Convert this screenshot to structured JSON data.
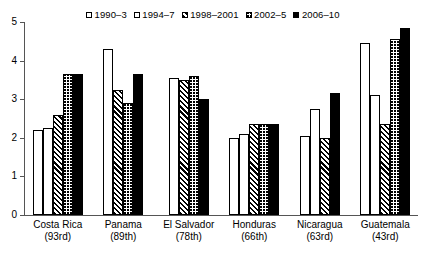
{
  "chart_data": {
    "type": "bar",
    "title": "",
    "xlabel": "",
    "ylabel": "",
    "ylim": [
      0,
      5
    ],
    "yticks": [
      "0",
      "1",
      "2",
      "3",
      "4",
      "5"
    ],
    "grid": false,
    "legend_position": "top",
    "categories": [
      "Costa Rica",
      "Panama",
      "El Salvador",
      "Honduras",
      "Nicaragua",
      "Guatemala"
    ],
    "category_ranks": [
      "(93rd)",
      "(89th)",
      "(78th)",
      "(66th)",
      "(63rd)",
      "(43rd)"
    ],
    "series": [
      {
        "name": "1990–3",
        "pattern": "white",
        "values": [
          2.2,
          null,
          null,
          2.0,
          2.05,
          4.45
        ]
      },
      {
        "name": "1994–7",
        "pattern": "dots",
        "values": [
          2.25,
          4.3,
          3.55,
          2.1,
          2.75,
          3.1
        ]
      },
      {
        "name": "1998–2001",
        "pattern": "diag",
        "values": [
          2.6,
          3.25,
          3.5,
          2.35,
          2.0,
          2.35
        ]
      },
      {
        "name": "2002–5",
        "pattern": "grid",
        "values": [
          3.65,
          2.9,
          3.6,
          2.35,
          null,
          4.55
        ]
      },
      {
        "name": "2006–10",
        "pattern": "black",
        "values": [
          3.65,
          3.65,
          3.0,
          2.35,
          3.15,
          4.85
        ]
      }
    ]
  },
  "legend": {
    "items": [
      {
        "label": "1990–3",
        "swatch": "white-swatch-icon"
      },
      {
        "label": "1994–7",
        "swatch": "dotted-swatch-icon"
      },
      {
        "label": "1998–2001",
        "swatch": "diagonal-swatch-icon"
      },
      {
        "label": "2002–5",
        "swatch": "grid-swatch-icon"
      },
      {
        "label": "2006–10",
        "swatch": "black-swatch-icon"
      }
    ]
  }
}
